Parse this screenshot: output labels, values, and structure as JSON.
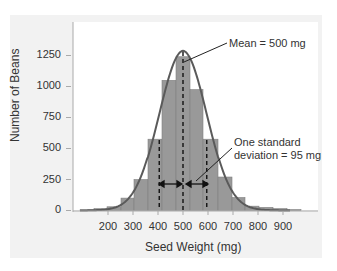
{
  "chart_data": {
    "type": "bar",
    "title": "",
    "xlabel": "Seed Weight (mg)",
    "ylabel": "Number of Beans",
    "xlim": [
      60,
      1000
    ],
    "ylim": [
      0,
      1350
    ],
    "x_ticks": [
      200,
      300,
      400,
      500,
      600,
      700,
      800,
      900
    ],
    "y_ticks": [
      0,
      250,
      500,
      750,
      1000,
      1250
    ],
    "grid": false,
    "bins": [
      {
        "start": 88,
        "end": 144,
        "value": 5
      },
      {
        "start": 144,
        "end": 196,
        "value": 15
      },
      {
        "start": 196,
        "end": 252,
        "value": 30
      },
      {
        "start": 252,
        "end": 304,
        "value": 100
      },
      {
        "start": 304,
        "end": 360,
        "value": 250
      },
      {
        "start": 360,
        "end": 416,
        "value": 575
      },
      {
        "start": 416,
        "end": 472,
        "value": 1050
      },
      {
        "start": 472,
        "end": 528,
        "value": 1240
      },
      {
        "start": 528,
        "end": 580,
        "value": 975
      },
      {
        "start": 580,
        "end": 640,
        "value": 575
      },
      {
        "start": 640,
        "end": 696,
        "value": 270
      },
      {
        "start": 696,
        "end": 748,
        "value": 105
      },
      {
        "start": 748,
        "end": 804,
        "value": 35
      },
      {
        "start": 804,
        "end": 860,
        "value": 25
      },
      {
        "start": 860,
        "end": 916,
        "value": 15
      },
      {
        "start": 916,
        "end": 972,
        "value": 8
      }
    ],
    "series": [
      {
        "name": "Normal curve fit",
        "type": "line",
        "mean": 500,
        "sd": 95,
        "peak": 1270
      }
    ],
    "annotations": [
      {
        "text": "Mean = 500 mg",
        "x": 500
      },
      {
        "text": "One standard deviation = 95 mg",
        "x_range": [
          405,
          595
        ]
      }
    ],
    "reference_lines": [
      405,
      500,
      595
    ],
    "colors": {
      "bar": "#999999",
      "bar_edge": "#808080",
      "curve": "#555555",
      "panel": "#f2f2f2",
      "plot": "#ffffff"
    }
  },
  "axes": {
    "y_ticks": [
      "1250",
      "1000",
      "750",
      "500",
      "250",
      "0"
    ],
    "x_ticks": [
      "200",
      "300",
      "400",
      "500",
      "600",
      "700",
      "800",
      "900"
    ],
    "xlabel": "Seed Weight (mg)",
    "ylabel": "Number of Beans"
  },
  "annotations": {
    "mean": "Mean = 500 mg",
    "sd_line1": "One standard",
    "sd_line2": "deviation = 95 mg"
  }
}
